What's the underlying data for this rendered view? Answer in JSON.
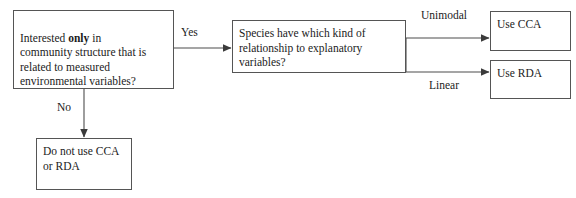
{
  "figure": {
    "type": "flowchart",
    "orientation": "left-to-right",
    "background_color": "#ffffff",
    "line_color": "#4d4d4d",
    "text_color": "#1b1b1b"
  },
  "nodes": {
    "decision_community": {
      "text_before_bold": "Interested ",
      "bold_word": "only",
      "text_after_bold": " in\ncommunity structure that is\nrelated to measured\nenvironmental variables?",
      "full_text": "Interested only in community structure that is related to measured environmental variables?"
    },
    "decision_relationship": {
      "text": "Species have which kind of\nrelationship to explanatory\nvariables?"
    },
    "outcome_cca": {
      "text": "Use CCA"
    },
    "outcome_rda": {
      "text": "Use RDA"
    },
    "outcome_none": {
      "text": "Do not use CCA\nor RDA"
    }
  },
  "edges": {
    "yes": {
      "label": "Yes",
      "from": "decision_community",
      "to": "decision_relationship"
    },
    "no": {
      "label": "No",
      "from": "decision_community",
      "to": "outcome_none"
    },
    "unimodal": {
      "label": "Unimodal",
      "from": "decision_relationship",
      "to": "outcome_cca"
    },
    "linear": {
      "label": "Linear",
      "from": "decision_relationship",
      "to": "outcome_rda"
    }
  }
}
